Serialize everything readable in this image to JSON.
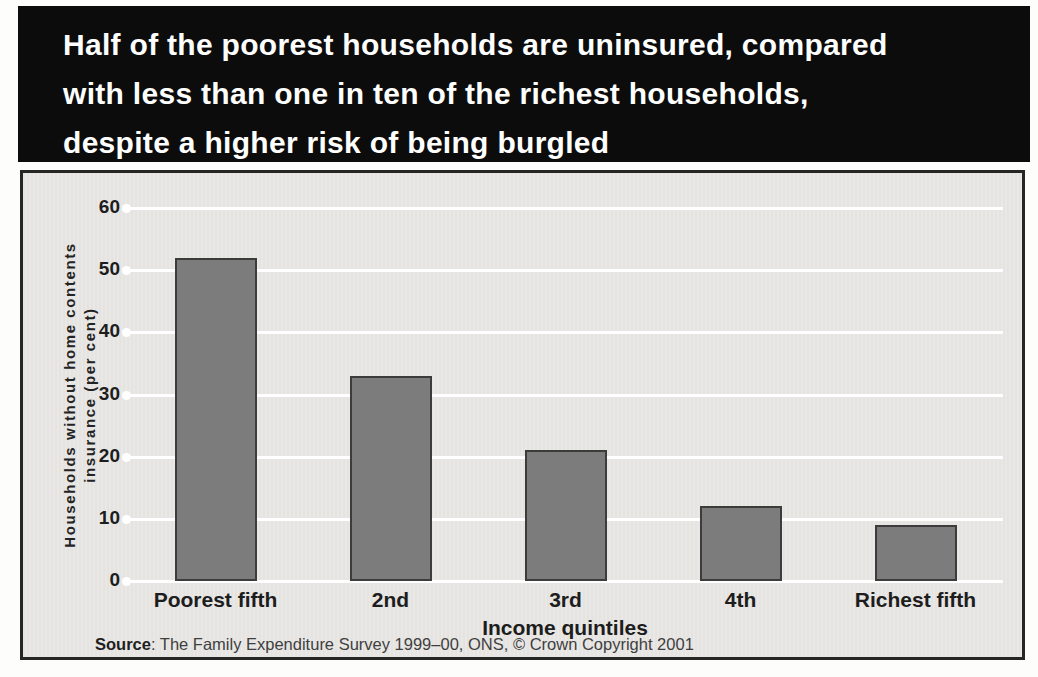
{
  "header": {
    "title_lines": [
      "Half of the poorest households are uninsured, compared",
      "with less than one in ten of the richest households,",
      "despite a higher risk of being burgled"
    ]
  },
  "chart_data": {
    "type": "bar",
    "title": "Half of the poorest households are uninsured, compared with less than one in ten of the richest households, despite a higher risk of being burgled",
    "categories": [
      "Poorest fifth",
      "2nd",
      "3rd",
      "4th",
      "Richest fifth"
    ],
    "values": [
      52,
      33,
      21,
      12,
      9
    ],
    "xlabel": "Income quintiles",
    "ylabel": "Households without home contents insurance (per cent)",
    "ylabel_line1": "Households without home contents",
    "ylabel_line2": "insurance (per cent)",
    "ylim": [
      0,
      60
    ],
    "yticks": [
      0,
      10,
      20,
      30,
      40,
      50,
      60
    ],
    "grid": true,
    "legend_position": "none",
    "bar_color": "#7c7c7c",
    "bar_border_color": "#3c3c3c",
    "plot_bg_color": "#e9e8e5",
    "grid_color": "#ffffff"
  },
  "footer": {
    "source_label": "Source",
    "source_rest": ": The Family Expenditure Survey 1999–00, ONS, © Crown Copyright 2001"
  },
  "colors": {
    "header_bg": "#0c0c0c",
    "header_text": "#ffffff",
    "panel_border": "#262626"
  }
}
